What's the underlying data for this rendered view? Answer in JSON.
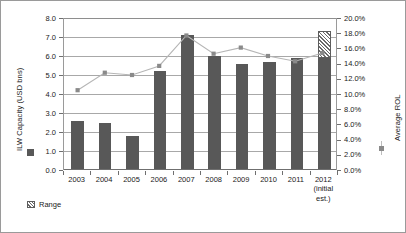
{
  "chart_data": {
    "type": "bar",
    "title": "",
    "subtitle": "",
    "xlabel": "",
    "ylabel": "ILW Capacity (USD bns)",
    "y2label": "Average ROL",
    "categories": [
      "2003",
      "2004",
      "2005",
      "2006",
      "2007",
      "2008",
      "2009",
      "2010",
      "2011",
      "2012"
    ],
    "category_sublabels": [
      "",
      "",
      "",
      "",
      "",
      "",
      "",
      "",
      "",
      "(initial\nest.)"
    ],
    "ylim": [
      0.0,
      8.0
    ],
    "y2lim": [
      0.0,
      20.0
    ],
    "yticks": [
      "0.0",
      "1.0",
      "2.0",
      "3.0",
      "4.0",
      "5.0",
      "6.0",
      "7.0",
      "8.0"
    ],
    "y2ticks": [
      "0.0%",
      "2.0%",
      "4.0%",
      "6.0%",
      "8.0%",
      "10.0%",
      "12.0%",
      "14.0%",
      "16.0%",
      "18.0%",
      "20.0%"
    ],
    "grid": true,
    "legend_position": "outside-left-and-bottom",
    "series": [
      {
        "name": "ILW Capacity",
        "type": "bar",
        "axis": "left",
        "legend_label": "",
        "color": "#585858",
        "values": [
          2.6,
          2.5,
          1.8,
          5.2,
          7.1,
          6.0,
          5.6,
          5.7,
          5.9,
          5.9
        ]
      },
      {
        "name": "Range",
        "type": "bar-extension",
        "axis": "left",
        "legend_label": "Range",
        "color": "hatched",
        "values": [
          null,
          null,
          null,
          null,
          null,
          null,
          null,
          null,
          null,
          7.3
        ],
        "range_from": 5.9,
        "range_to": 7.3
      },
      {
        "name": "Average ROL",
        "type": "line",
        "axis": "right",
        "legend_label": "",
        "color": "#b5b5b5",
        "marker_color": "#8a8a8a",
        "values": [
          10.5,
          12.8,
          12.5,
          13.7,
          17.7,
          15.3,
          16.1,
          15.0,
          14.3,
          15.4
        ]
      }
    ]
  },
  "legends": {
    "capacity_swatch_name": "ILW Capacity",
    "range_label": "Range",
    "rol_swatch_name": "Average ROL"
  }
}
